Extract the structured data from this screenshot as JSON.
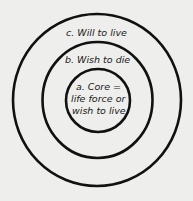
{
  "diagram": {
    "type": "concentric-circles",
    "colors": {
      "background": "#eeeeec",
      "stroke": "#111111",
      "text": "#1a1a1a"
    },
    "rings": [
      {
        "id": "c",
        "label": "c.  Will to live",
        "cx": 97,
        "cy": 100,
        "rx": 84,
        "ry": 86
      },
      {
        "id": "b",
        "label": "b.  Wish to die",
        "cx": 97.5,
        "cy": 100,
        "rx": 55,
        "ry": 58
      },
      {
        "id": "a",
        "label_lines": [
          "a.  Core =",
          "life force or",
          "wish to live"
        ],
        "cx": 98,
        "cy": 100.5,
        "rx": 32,
        "ry": 31.5
      }
    ]
  }
}
